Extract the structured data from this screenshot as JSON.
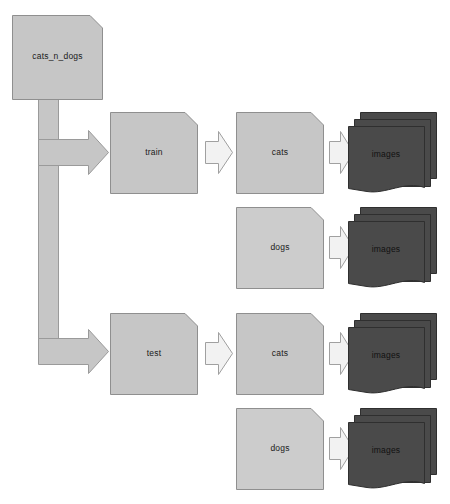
{
  "diagram": {
    "type": "tree-flowchart",
    "canvas": {
      "width": 450,
      "height": 504
    },
    "colors": {
      "background": "#ffffff",
      "folder_fill": "#c6c6c6",
      "folder_fill_light": "#cccccc",
      "folder_stroke": "#8f8f8f",
      "image_stack_fill": "#4a4a4a",
      "image_stack_stroke": "#2f2f2f",
      "arrow_fill": "#f2f2f2",
      "arrow_stroke": "#a0a0a0",
      "connector_fill": "#c6c6c6",
      "connector_stroke": "#9a9a9a",
      "label_text": "#1a1a1a"
    },
    "root": {
      "label": "cats_n_dogs",
      "shape": "document"
    },
    "levels": [
      {
        "name": "root",
        "items": [
          "cats_n_dogs"
        ]
      },
      {
        "name": "split",
        "items": [
          "train",
          "test"
        ]
      },
      {
        "name": "class",
        "items": [
          "cats",
          "dogs",
          "cats",
          "dogs"
        ]
      },
      {
        "name": "contents",
        "items": [
          "images",
          "images",
          "images",
          "images"
        ]
      }
    ],
    "splits": [
      {
        "label": "train",
        "shape": "document",
        "classes": [
          {
            "label": "cats",
            "shape": "document",
            "contents": {
              "label": "images",
              "shape": "document-stack",
              "count": 3
            }
          },
          {
            "label": "dogs",
            "shape": "document",
            "contents": {
              "label": "images",
              "shape": "document-stack",
              "count": 3
            }
          }
        ]
      },
      {
        "label": "test",
        "shape": "document",
        "classes": [
          {
            "label": "cats",
            "shape": "document",
            "contents": {
              "label": "images",
              "shape": "document-stack",
              "count": 3
            }
          },
          {
            "label": "dogs",
            "shape": "document",
            "contents": {
              "label": "images",
              "shape": "document-stack",
              "count": 3
            }
          }
        ]
      }
    ],
    "arrows": {
      "root_to_train": "elbow-arrow-right",
      "root_to_test": "elbow-arrow-right",
      "split_to_class": "chevron-arrow-right",
      "class_to_images": "chevron-arrow-right"
    },
    "nodes": {
      "root": "cats_n_dogs",
      "train": "train",
      "test": "test",
      "train_cats": "cats",
      "train_dogs": "dogs",
      "test_cats": "cats",
      "test_dogs": "dogs",
      "train_cats_images": "images",
      "train_dogs_images": "images",
      "test_cats_images": "images",
      "test_dogs_images": "images"
    }
  }
}
